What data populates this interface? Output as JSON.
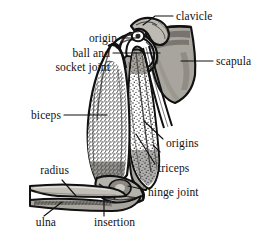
{
  "figure": {
    "width": 276,
    "height": 243,
    "background_color": "#ffffff"
  },
  "palette": {
    "outline": "#111111",
    "bone_gray": "#a8a49e",
    "bone_gray_dark": "#8b8780",
    "bone_light": "#cac6c0",
    "muscle_white": "#ffffff",
    "stipple": "#1a1a1a",
    "text": "#111111"
  },
  "labels": [
    {
      "id": "clavicle",
      "text": "clavicle",
      "x": 176,
      "y": 16,
      "align": "left"
    },
    {
      "id": "origin",
      "text": "origin",
      "x": 117,
      "y": 38,
      "align": "right"
    },
    {
      "id": "ball-socket-joint",
      "text": "ball and\nsocket joint",
      "x": 110,
      "y": 60,
      "align": "right"
    },
    {
      "id": "scapula",
      "text": "scapula",
      "x": 216,
      "y": 61,
      "align": "left"
    },
    {
      "id": "biceps",
      "text": "biceps",
      "x": 61,
      "y": 115,
      "align": "right"
    },
    {
      "id": "origins",
      "text": "origins",
      "x": 166,
      "y": 143,
      "align": "left"
    },
    {
      "id": "triceps",
      "text": "triceps",
      "x": 158,
      "y": 168,
      "align": "left"
    },
    {
      "id": "radius",
      "text": "radius",
      "x": 69,
      "y": 170,
      "align": "right"
    },
    {
      "id": "hinge-joint",
      "text": "hinge joint",
      "x": 148,
      "y": 192,
      "align": "left"
    },
    {
      "id": "ulna",
      "text": "ulna",
      "x": 56,
      "y": 222,
      "align": "right"
    },
    {
      "id": "insertion",
      "text": "insertion",
      "x": 94,
      "y": 222,
      "align": "left"
    }
  ],
  "leader_lines": [
    {
      "id": "clavicle-leader",
      "points": "173,16 155,16 143,25"
    },
    {
      "id": "origin-leader",
      "points": "120,38 139,38"
    },
    {
      "id": "ball-socket-leader",
      "points": "113,53 160,53"
    },
    {
      "id": "scapula-leader",
      "points": "213,61 181,61"
    },
    {
      "id": "biceps-leader",
      "points": "64,115 107,115"
    },
    {
      "id": "origins-leader-a",
      "points": "163,139 144,121"
    },
    {
      "id": "origins-leader-b",
      "points": "160,152 153,145"
    },
    {
      "id": "triceps-leader",
      "points": "155,164 136,134"
    },
    {
      "id": "radius-leader",
      "points": "62,180 76,196"
    },
    {
      "id": "hinge-joint-leader",
      "points": "146,190 128,186"
    },
    {
      "id": "ulna-leader",
      "points": "44,216 62,202"
    },
    {
      "id": "insertion-leader",
      "points": "104,216 104,196"
    }
  ],
  "anatomy_parts": [
    {
      "id": "clavicle",
      "name": "clavicle",
      "kind": "bone",
      "fill": "#b5b1ab"
    },
    {
      "id": "scapula",
      "name": "scapula",
      "kind": "bone",
      "fill": "#a8a49e"
    },
    {
      "id": "humerus",
      "name": "humerus",
      "kind": "bone",
      "fill": "#a8a49e"
    },
    {
      "id": "radius",
      "name": "radius",
      "kind": "bone",
      "fill": "#b5b1ab"
    },
    {
      "id": "ulna",
      "name": "ulna",
      "kind": "bone",
      "fill": "#a8a49e"
    },
    {
      "id": "biceps",
      "name": "biceps",
      "kind": "muscle",
      "fill": "#ffffff"
    },
    {
      "id": "triceps",
      "name": "triceps",
      "kind": "muscle",
      "fill": "#ffffff"
    }
  ]
}
